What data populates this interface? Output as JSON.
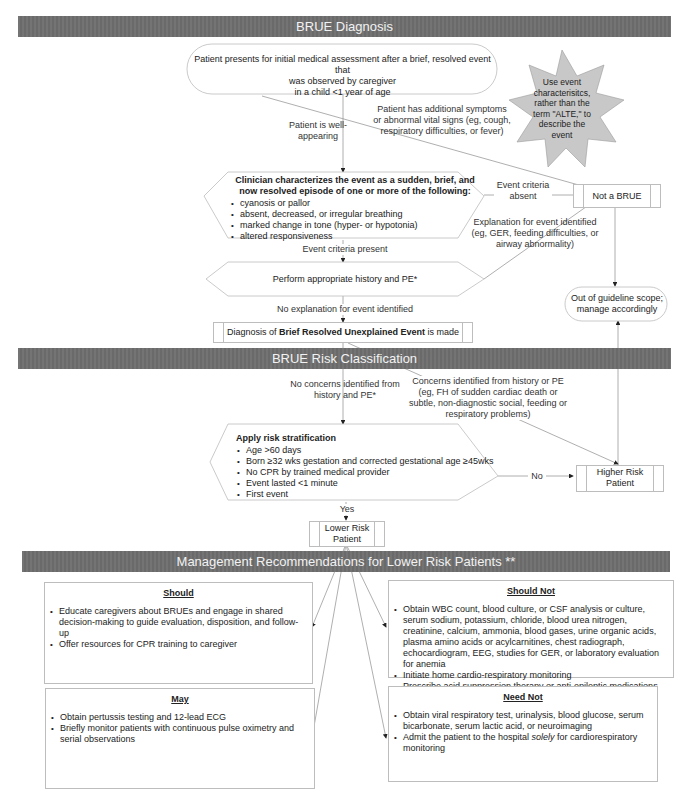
{
  "sections": {
    "diagnosis": "BRUE Diagnosis",
    "risk": "BRUE Risk Classification",
    "management": "Management Recommendations for Lower Risk Patients **"
  },
  "nodes": {
    "start": {
      "line1": "Patient presents for initial medical assessment after a brief, resolved event that",
      "line2": "was observed by caregiver",
      "line3": "in a child <1 year of age"
    },
    "star_note": "Use event characterisitcs, rather than the term \"ALTE,\" to describe the event",
    "characterize": {
      "title": "Clinician characterizes the event as a sudden, brief, and now resolved episode of one or more of the following:",
      "items": [
        "cyanosis or pallor",
        "absent, decreased, or irregular breathing",
        "marked change in tone (hyper- or hypotonia)",
        "altered responsiveness"
      ]
    },
    "not_brue": "Not a BRUE",
    "out_of_scope": "Out of guideline scope; manage accordingly",
    "history_pe": "Perform appropriate history and PE*",
    "diagnosis_made": {
      "prefix": "Diagnosis of ",
      "bold": "Brief Resolved Unexplained Event",
      "suffix": " is made"
    },
    "risk_strat": {
      "title": "Apply risk stratification",
      "items": [
        "Age >60 days",
        "Born ≥32 wks gestation and corrected gestational age ≥45wks",
        "No CPR by trained medical provider",
        "Event lasted <1 minute",
        "First event"
      ]
    },
    "higher_risk": "Higher Risk Patient",
    "lower_risk": "Lower Risk Patient"
  },
  "edge_labels": {
    "well_appearing": "Patient is well-appearing",
    "additional_symptoms": "Patient has additional symptoms or abnormal vital signs (eg, cough, respiratory difficulties, or fever)",
    "criteria_absent": "Event criteria absent",
    "explanation_identified": "Explanation for event identified (eg, GER, feeding difficulties, or airway abnormality)",
    "criteria_present": "Event criteria present",
    "no_explanation": "No explanation for event identified",
    "no_concerns": "No concerns identified from history and PE*",
    "concerns": "Concerns identified from history or PE (eg, FH of sudden cardiac death or subtle, non-diagnostic social, feeding or respiratory problems)",
    "no": "No",
    "yes": "Yes"
  },
  "recommendations": {
    "should": {
      "title": "Should",
      "items": [
        "Educate caregivers about BRUEs and engage in shared decision-making to guide evaluation, disposition, and follow-up",
        "Offer resources for CPR training to caregiver"
      ]
    },
    "should_not": {
      "title": "Should Not",
      "items": [
        "Obtain WBC count, blood culture, or CSF analysis or culture, serum sodium, potassium, chloride, blood urea nitrogen, creatinine, calcium, ammonia, blood gases, urine organic acids, plasma amino acids or acylcarnitines, chest radiograph, echocardiogram, EEG, studies for GER, or laboratory evaluation for anemia",
        "Initiate home cardio-respiratory monitoring",
        "Prescribe acid suppression therapy or anti-epileptic medications"
      ]
    },
    "may": {
      "title": "May",
      "items": [
        "Obtain pertussis testing and 12-lead ECG",
        "Briefly monitor patients with continuous pulse oximetry and serial observations"
      ]
    },
    "need_not": {
      "title": "Need Not",
      "items_prefix": "Obtain viral respiratory test, urinalysis, blood glucose, serum bicarbonate, serum lactic acid, or neuroimaging",
      "admit_a": "Admit the patient to the hospital ",
      "admit_em": "solely",
      "admit_b": " for cardiorespiratory monitoring"
    }
  },
  "colors": {
    "banner": "#6e6e6e",
    "star": "#c8c8c8",
    "line": "#9a9a9a",
    "border": "#bdbdbd"
  }
}
